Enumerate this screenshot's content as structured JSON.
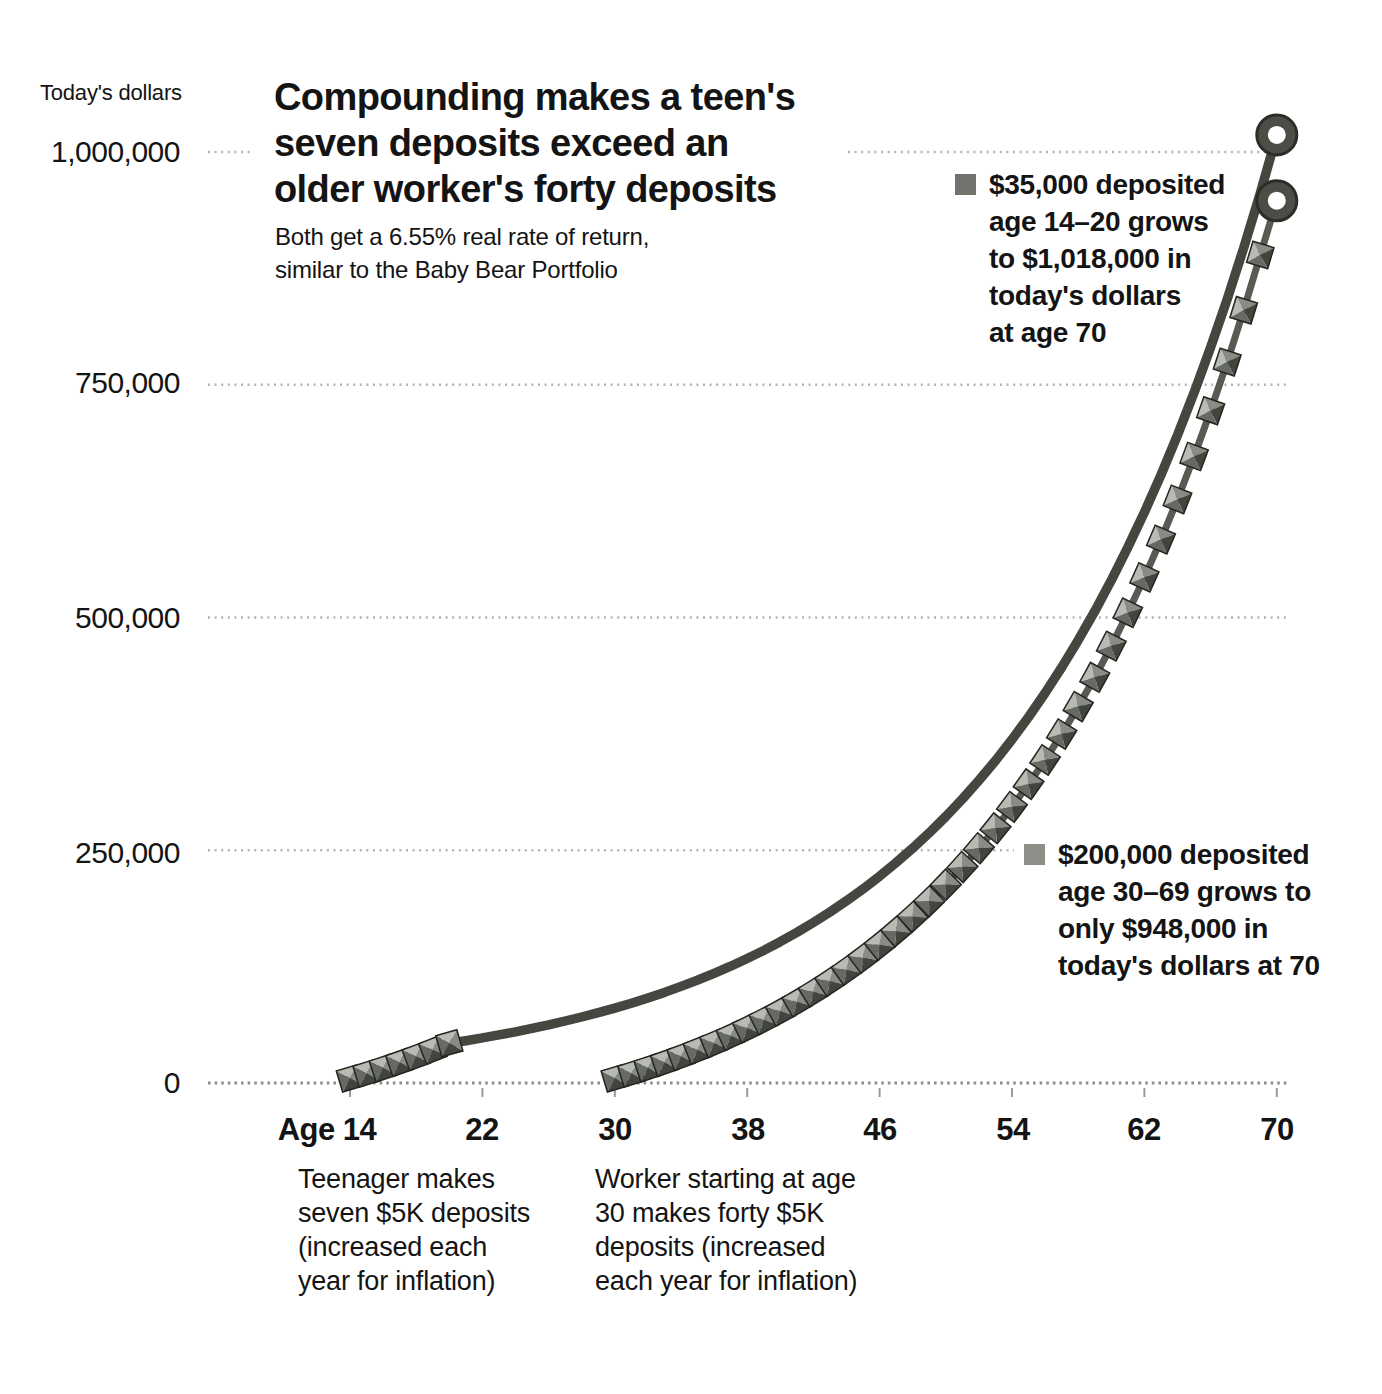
{
  "header": {
    "title_lines": [
      "Compounding makes a teen's",
      "seven deposits exceed an",
      "older worker's forty deposits"
    ],
    "subtitle_lines": [
      "Both get a 6.55% real rate of return,",
      "similar to the Baby Bear Portfolio"
    ]
  },
  "y_axis": {
    "title": "Today's dollars",
    "tick_labels": [
      "1,000,000",
      "750,000",
      "500,000",
      "250,000",
      "0"
    ]
  },
  "x_axis": {
    "tick_labels": [
      "Age 14",
      "22",
      "30",
      "38",
      "46",
      "54",
      "62",
      "70"
    ]
  },
  "annotations": {
    "teen": {
      "lines": [
        "$35,000 deposited",
        "age 14–20 grows",
        "to $1,018,000 in",
        "today's dollars",
        "at age 70"
      ]
    },
    "worker": {
      "lines": [
        "$200,000 deposited",
        "age 30–69 grows to",
        "only $948,000 in",
        "today's dollars at 70"
      ]
    }
  },
  "captions": {
    "teen": {
      "lines": [
        "Teenager makes",
        "seven $5K deposits",
        "(increased each",
        "year for inflation)"
      ]
    },
    "worker": {
      "lines": [
        "Worker starting at age",
        "30 makes forty $5K",
        "deposits (increased",
        "each year for inflation)"
      ]
    }
  },
  "colors": {
    "teen_line": "#43473f",
    "worker_line": "#575b53",
    "marker_top": "#b7bbb3",
    "marker_right": "#888c84",
    "marker_left": "#666a62",
    "marker_bottom": "#41453d",
    "marker_edge": "#23261f",
    "ring_fill": "#4a4e46",
    "ring_edge": "#2b2e27",
    "grid_dot": "#b4b4b4",
    "axis_dot": "#8e8e8e",
    "bullet_teen": "#70746c",
    "bullet_worker": "#8b8f87",
    "text": "#141414"
  },
  "chart_data": {
    "type": "line",
    "title": "Compounding makes a teen's seven deposits exceed an older worker's forty deposits",
    "subtitle": "Both get a 6.55% real rate of return, similar to the Baby Bear Portfolio",
    "ylabel": "Today's dollars",
    "real_rate_of_return_pct": 6.55,
    "grid": "horizontal-dotted",
    "legend_position": "inline-annotations",
    "ylim": [
      0,
      1050000
    ],
    "yticks": [
      1000000,
      750000,
      500000,
      250000,
      0
    ],
    "xticks": [
      14,
      22,
      30,
      38,
      46,
      54,
      62,
      70
    ],
    "series": [
      {
        "name": "Teen: seven $5K deposits age 14-20",
        "total_deposited": 35000,
        "deposit_ages": [
          14,
          20
        ],
        "final_value_today": 1018000,
        "x": [
          14,
          15,
          16,
          17,
          18,
          19,
          20,
          21,
          22,
          23,
          24,
          25,
          26,
          27,
          28,
          29,
          30,
          31,
          32,
          33,
          34,
          35,
          36,
          37,
          38,
          39,
          40,
          41,
          42,
          43,
          44,
          45,
          46,
          47,
          48,
          49,
          50,
          51,
          52,
          53,
          54,
          55,
          56,
          57,
          58,
          59,
          60,
          61,
          62,
          63,
          64,
          65,
          66,
          67,
          68,
          69,
          70
        ],
        "values": [
          5000,
          10328,
          16004,
          22052,
          28497,
          35363,
          42679,
          45475,
          48453,
          51627,
          55009,
          58612,
          62451,
          66542,
          70900,
          75544,
          80492,
          85764,
          91382,
          97368,
          103745,
          110540,
          117781,
          125495,
          133715,
          142474,
          151806,
          161749,
          172344,
          183632,
          195660,
          208476,
          222131,
          236681,
          252183,
          268701,
          286301,
          305054,
          325035,
          346325,
          369009,
          393179,
          418932,
          446372,
          475609,
          506762,
          539955,
          575322,
          613006,
          653158,
          695940,
          741524,
          790094,
          841845,
          896986,
          955739,
          1018340
        ]
      },
      {
        "name": "Worker: forty $5K deposits age 30-69",
        "total_deposited": 200000,
        "deposit_ages": [
          30,
          69
        ],
        "final_value_today": 948000,
        "x": [
          30,
          31,
          32,
          33,
          34,
          35,
          36,
          37,
          38,
          39,
          40,
          41,
          42,
          43,
          44,
          45,
          46,
          47,
          48,
          49,
          50,
          51,
          52,
          53,
          54,
          55,
          56,
          57,
          58,
          59,
          60,
          61,
          62,
          63,
          64,
          65,
          66,
          67,
          68,
          69,
          70
        ],
        "values": [
          5000,
          10328,
          16004,
          22052,
          28497,
          35363,
          42679,
          50475,
          58781,
          67631,
          77061,
          87108,
          97813,
          109219,
          121373,
          134323,
          148121,
          162823,
          178488,
          195179,
          212963,
          231912,
          252102,
          273615,
          296537,
          320960,
          346983,
          374710,
          404254,
          435733,
          469273,
          505011,
          543089,
          583661,
          626891,
          672952,
          722030,
          774323,
          830041,
          889409,
          947665
        ]
      }
    ]
  }
}
